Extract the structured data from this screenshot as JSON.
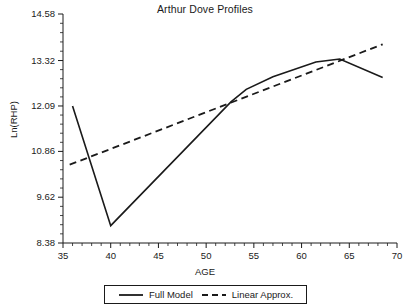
{
  "chart_data": {
    "type": "line",
    "title": "Arthur Dove Profiles",
    "xlabel": "AGE",
    "ylabel": "Ln(RHP)",
    "xlim": [
      35,
      70
    ],
    "ylim": [
      8.38,
      14.58
    ],
    "grid": false,
    "legend_position": "bottom-center",
    "x_ticks": [
      35,
      40,
      45,
      50,
      55,
      60,
      65,
      70
    ],
    "x_tick_labels": [
      "35",
      "40",
      "45",
      "50",
      "55",
      "60",
      "65",
      "70"
    ],
    "x_minor_tick_step": 1,
    "y_ticks": [
      8.38,
      9.62,
      10.86,
      12.09,
      13.32,
      14.58
    ],
    "y_tick_labels": [
      "8.38",
      "9.62",
      "10.86",
      "12.09",
      "13.32",
      "14.58"
    ],
    "y_minor_ticks_per_interval": 4,
    "series": [
      {
        "name": "Full Model",
        "style": "solid",
        "color": "#1a1a1a",
        "x": [
          36.0,
          40.0,
          52.6,
          54.2,
          57.0,
          61.5,
          64.0,
          68.5
        ],
        "y": [
          12.09,
          8.85,
          12.2,
          12.54,
          12.88,
          13.28,
          13.36,
          12.86
        ]
      },
      {
        "name": "Linear Approx.",
        "style": "dashed",
        "color": "#1a1a1a",
        "x": [
          35.7,
          68.5
        ],
        "y": [
          10.5,
          13.76
        ]
      }
    ],
    "legend": [
      {
        "label": "Full Model",
        "style": "solid"
      },
      {
        "label": "Linear Approx.",
        "style": "dashed"
      }
    ]
  }
}
